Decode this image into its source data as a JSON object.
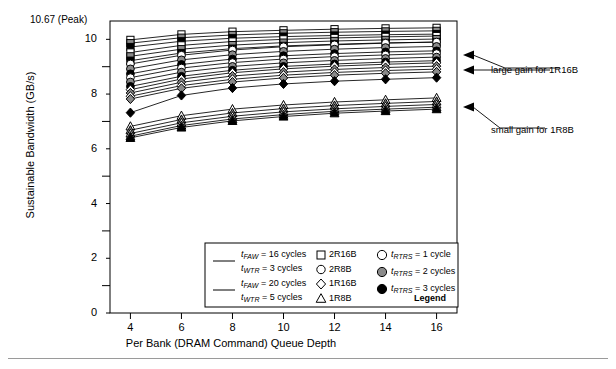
{
  "figure": {
    "axis_title_x": "Per Bank (DRAM Command) Queue Depth",
    "axis_title_y": "Sustainable Bandwidth (GB/s)",
    "peak_label": "10.67 (Peak)"
  },
  "annotations": {
    "large_gain": "large gain for 1R16B",
    "small_gain": "small gain for 1R8B"
  },
  "legend": {
    "title": "Legend",
    "line_entries": [
      {
        "line1_pre": "t",
        "line1_sub": "FAW",
        "line1_post": " = 16 cycles",
        "line2_pre": "t",
        "line2_sub": "WTR",
        "line2_post": " = 3 cycles"
      },
      {
        "line1_pre": "t",
        "line1_sub": "FAW",
        "line1_post": " = 20 cycles",
        "line2_pre": "t",
        "line2_sub": "WTR",
        "line2_post": " = 5 cycles"
      }
    ],
    "shape_entries": [
      {
        "shape": "square-open-icon",
        "label": "2R16B"
      },
      {
        "shape": "circle-open-icon",
        "label": "2R8B"
      },
      {
        "shape": "diamond-open-icon",
        "label": "1R16B"
      },
      {
        "shape": "triangle-open-icon",
        "label": "1R8B"
      }
    ],
    "fill_entries": [
      {
        "shape": "circle-white-icon",
        "pre": "t",
        "sub": "RTRS",
        "post": " = 1 cycle"
      },
      {
        "shape": "circle-gray-icon",
        "pre": "t",
        "sub": "RTRS",
        "post": " = 2 cycles"
      },
      {
        "shape": "circle-black-icon",
        "pre": "t",
        "sub": "RTRS",
        "post": " = 3 cycles"
      }
    ]
  },
  "chart_data": {
    "type": "line",
    "title": "",
    "xlabel": "Per Bank (DRAM Command) Queue Depth",
    "ylabel": "Sustainable Bandwidth (GB/s)",
    "xlim": [
      3.2,
      16.8
    ],
    "ylim": [
      0,
      10.67
    ],
    "yticks_major": [
      0,
      2,
      4,
      6,
      8,
      10
    ],
    "yticks_minor": [
      1,
      3,
      5,
      7,
      9
    ],
    "ytick_top_label": "10.67 (Peak)",
    "grid": false,
    "legend_position": "inside-bottom-center",
    "x": [
      4,
      6,
      8,
      10,
      12,
      14,
      16
    ],
    "series": [
      {
        "name": "2R16B tFAW=16 tWTR=3 tRTRS=1",
        "marker": "square",
        "fill": "white",
        "tfaw": 16,
        "twtr": 3,
        "trtrs": 1,
        "values": [
          9.98,
          10.18,
          10.28,
          10.33,
          10.37,
          10.4,
          10.42
        ]
      },
      {
        "name": "2R16B tFAW=16 tWTR=3 tRTRS=2",
        "marker": "square",
        "fill": "gray",
        "tfaw": 16,
        "twtr": 3,
        "trtrs": 2,
        "values": [
          9.86,
          10.06,
          10.16,
          10.22,
          10.26,
          10.29,
          10.31
        ]
      },
      {
        "name": "2R16B tFAW=16 tWTR=3 tRTRS=3",
        "marker": "square",
        "fill": "black",
        "tfaw": 16,
        "twtr": 3,
        "trtrs": 3,
        "values": [
          9.72,
          9.93,
          10.04,
          10.1,
          10.14,
          10.17,
          10.19
        ]
      },
      {
        "name": "2R16B tFAW=20 tWTR=5 tRTRS=1",
        "marker": "square",
        "fill": "white",
        "tfaw": 20,
        "twtr": 5,
        "trtrs": 1,
        "values": [
          9.52,
          9.78,
          9.92,
          10.0,
          10.05,
          10.09,
          10.12
        ]
      },
      {
        "name": "2R16B tFAW=20 tWTR=5 tRTRS=2",
        "marker": "square",
        "fill": "gray",
        "tfaw": 20,
        "twtr": 5,
        "trtrs": 2,
        "values": [
          9.38,
          9.64,
          9.79,
          9.88,
          9.94,
          9.98,
          10.01
        ]
      },
      {
        "name": "2R16B tFAW=20 tWTR=5 tRTRS=3",
        "marker": "square",
        "fill": "black",
        "tfaw": 20,
        "twtr": 5,
        "trtrs": 3,
        "values": [
          9.22,
          9.5,
          9.66,
          9.76,
          9.82,
          9.87,
          9.9
        ]
      },
      {
        "name": "2R8B tFAW=16 tWTR=3 tRTRS=1",
        "marker": "circle",
        "fill": "white",
        "tfaw": 16,
        "twtr": 3,
        "trtrs": 1,
        "values": [
          9.1,
          9.42,
          9.61,
          9.73,
          9.8,
          9.86,
          9.9
        ]
      },
      {
        "name": "2R8B tFAW=16 tWTR=3 tRTRS=2",
        "marker": "circle",
        "fill": "gray",
        "tfaw": 16,
        "twtr": 3,
        "trtrs": 2,
        "values": [
          8.92,
          9.25,
          9.44,
          9.56,
          9.64,
          9.7,
          9.74
        ]
      },
      {
        "name": "2R8B tFAW=16 tWTR=3 tRTRS=3",
        "marker": "circle",
        "fill": "black",
        "tfaw": 16,
        "twtr": 3,
        "trtrs": 3,
        "values": [
          8.74,
          9.08,
          9.28,
          9.4,
          9.48,
          9.54,
          9.58
        ]
      },
      {
        "name": "2R8B tFAW=20 tWTR=5 tRTRS=1",
        "marker": "circle",
        "fill": "white",
        "tfaw": 20,
        "twtr": 5,
        "trtrs": 1,
        "values": [
          8.6,
          8.95,
          9.15,
          9.28,
          9.37,
          9.43,
          9.48
        ]
      },
      {
        "name": "2R8B tFAW=20 tWTR=5 tRTRS=2",
        "marker": "circle",
        "fill": "gray",
        "tfaw": 20,
        "twtr": 5,
        "trtrs": 2,
        "values": [
          8.44,
          8.8,
          9.01,
          9.14,
          9.23,
          9.3,
          9.35
        ]
      },
      {
        "name": "2R8B tFAW=20 tWTR=5 tRTRS=3",
        "marker": "circle",
        "fill": "black",
        "tfaw": 20,
        "twtr": 5,
        "trtrs": 3,
        "values": [
          8.28,
          8.65,
          8.87,
          9.01,
          9.1,
          9.17,
          9.22
        ]
      },
      {
        "name": "1R16B tFAW=16 tWTR=3 tRTRS=1",
        "marker": "diamond",
        "fill": "white",
        "tfaw": 16,
        "twtr": 3,
        "trtrs": 1,
        "values": [
          8.16,
          8.55,
          8.78,
          8.92,
          9.02,
          9.09,
          9.14
        ]
      },
      {
        "name": "1R16B tFAW=16 tWTR=3 tRTRS=2",
        "marker": "diamond",
        "fill": "gray",
        "tfaw": 16,
        "twtr": 3,
        "trtrs": 2,
        "values": [
          8.04,
          8.43,
          8.66,
          8.8,
          8.9,
          8.97,
          9.02
        ]
      },
      {
        "name": "1R16B tFAW=20 tWTR=5 tRTRS=1",
        "marker": "diamond",
        "fill": "white",
        "tfaw": 20,
        "twtr": 5,
        "trtrs": 1,
        "values": [
          7.92,
          8.31,
          8.54,
          8.69,
          8.79,
          8.86,
          8.91
        ]
      },
      {
        "name": "1R16B tFAW=20 tWTR=5 tRTRS=2",
        "marker": "diamond",
        "fill": "gray",
        "tfaw": 20,
        "twtr": 5,
        "trtrs": 2,
        "values": [
          7.82,
          8.21,
          8.44,
          8.59,
          8.69,
          8.76,
          8.81
        ]
      },
      {
        "name": "1R16B tFAW=16 tWTR=3 tRTRS=3",
        "marker": "diamond",
        "fill": "black",
        "tfaw": 16,
        "twtr": 3,
        "trtrs": 3,
        "values": [
          7.32,
          7.95,
          8.22,
          8.37,
          8.47,
          8.54,
          8.6
        ]
      },
      {
        "name": "1R8B tFAW=16 tWTR=3 tRTRS=1",
        "marker": "triangle",
        "fill": "white",
        "tfaw": 16,
        "twtr": 3,
        "trtrs": 1,
        "values": [
          6.82,
          7.21,
          7.45,
          7.6,
          7.71,
          7.79,
          7.86
        ]
      },
      {
        "name": "1R8B tFAW=16 tWTR=3 tRTRS=2",
        "marker": "triangle",
        "fill": "gray",
        "tfaw": 16,
        "twtr": 3,
        "trtrs": 2,
        "values": [
          6.68,
          7.07,
          7.31,
          7.47,
          7.58,
          7.66,
          7.73
        ]
      },
      {
        "name": "1R8B tFAW=20 tWTR=5 tRTRS=1",
        "marker": "triangle",
        "fill": "white",
        "tfaw": 20,
        "twtr": 5,
        "trtrs": 1,
        "values": [
          6.56,
          6.95,
          7.19,
          7.35,
          7.46,
          7.55,
          7.62
        ]
      },
      {
        "name": "1R8B tFAW=20 tWTR=5 tRTRS=2",
        "marker": "triangle",
        "fill": "gray",
        "tfaw": 20,
        "twtr": 5,
        "trtrs": 2,
        "values": [
          6.46,
          6.85,
          7.09,
          7.25,
          7.37,
          7.45,
          7.52
        ]
      },
      {
        "name": "1R8B tFAW=16 tWTR=3 tRTRS=3",
        "marker": "triangle",
        "fill": "black",
        "tfaw": 16,
        "twtr": 3,
        "trtrs": 3,
        "values": [
          6.4,
          6.78,
          7.02,
          7.18,
          7.3,
          7.38,
          7.45
        ]
      }
    ],
    "xticks": [
      4,
      6,
      8,
      10,
      12,
      14,
      16
    ],
    "annotations": [
      {
        "text": "large gain for 1R16B",
        "target_x": 16,
        "target_y": 9.0
      },
      {
        "text": "large gain for 1R16B",
        "target_x": 16,
        "target_y": 8.6
      },
      {
        "text": "small gain for 1R8B",
        "target_x": 16,
        "target_y": 7.5
      }
    ]
  }
}
